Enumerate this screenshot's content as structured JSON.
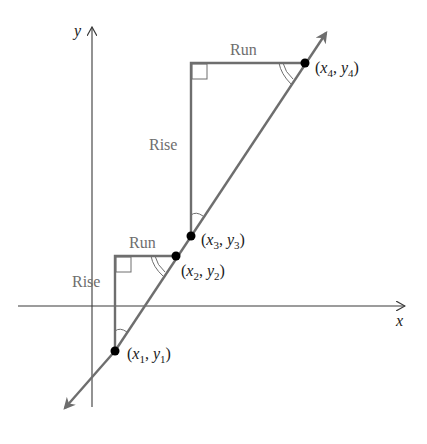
{
  "diagram": {
    "title": "",
    "axes": {
      "x_label": "x",
      "y_label": "y"
    },
    "triangles": [
      {
        "id": "small",
        "rise_label": "Rise",
        "run_label": "Run"
      },
      {
        "id": "large",
        "rise_label": "Rise",
        "run_label": "Run"
      }
    ],
    "points": [
      {
        "id": "p1",
        "var_x": "x",
        "var_y": "y",
        "sub": "1"
      },
      {
        "id": "p2",
        "var_x": "x",
        "var_y": "y",
        "sub": "2"
      },
      {
        "id": "p3",
        "var_x": "x",
        "var_y": "y",
        "sub": "3"
      },
      {
        "id": "p4",
        "var_x": "x",
        "var_y": "y",
        "sub": "4"
      }
    ],
    "colors": {
      "axis": "#3a3a3a",
      "line": "#6e6e6e",
      "triangle": "#6e6e6e",
      "point": "#000000",
      "label_gray": "#6e6e6e",
      "label_dark": "#1a1a1a"
    }
  }
}
